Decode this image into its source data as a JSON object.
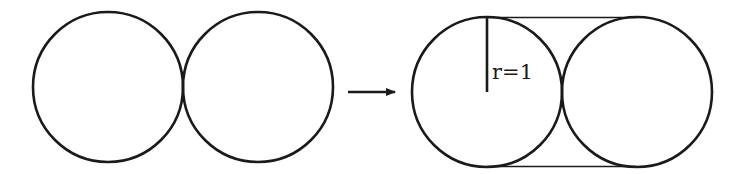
{
  "diagram": {
    "stroke_color": "#1a1a1a",
    "background": "#ffffff",
    "left_group": {
      "circles": [
        {
          "cx": 108,
          "cy": 87,
          "r": 75
        },
        {
          "cx": 258,
          "cy": 87,
          "r": 75
        }
      ]
    },
    "arrow": {
      "x1": 348,
      "y1": 92,
      "x2": 395,
      "y2": 92,
      "direction": "right"
    },
    "right_group": {
      "circles": [
        {
          "cx": 487,
          "cy": 92,
          "r": 75
        },
        {
          "cx": 637,
          "cy": 92,
          "r": 75
        }
      ],
      "tangent_lines": [
        {
          "x1": 487,
          "y1": 17.5,
          "x2": 637,
          "y2": 17.5
        },
        {
          "x1": 487,
          "y1": 166.5,
          "x2": 637,
          "y2": 166.5
        }
      ],
      "radius": {
        "x1": 487,
        "y1": 18,
        "x2": 487,
        "y2": 92,
        "label": "r=1",
        "label_x": 492,
        "label_y": 79
      }
    }
  }
}
